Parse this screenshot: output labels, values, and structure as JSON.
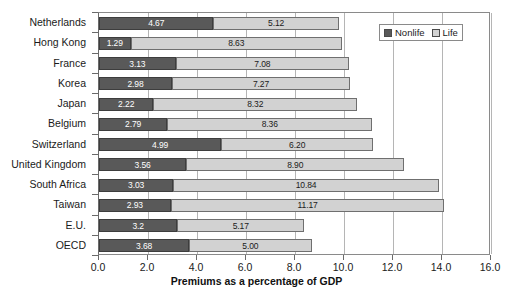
{
  "chart_data": {
    "type": "bar",
    "orientation": "horizontal",
    "stacked": true,
    "title": "",
    "xlabel": "Premiums as a percentage of GDP",
    "ylabel": "",
    "xlim": [
      0.0,
      16.0
    ],
    "xticks": [
      "0.0",
      "2.0",
      "4.0",
      "6.0",
      "8.0",
      "10.0",
      "12.0",
      "14.0",
      "16.0"
    ],
    "xtick_values": [
      0.0,
      2.0,
      4.0,
      6.0,
      8.0,
      10.0,
      12.0,
      14.0,
      16.0
    ],
    "grid": "vertical",
    "legend_position": "top-right",
    "categories": [
      "Netherlands",
      "Hong Kong",
      "France",
      "Korea",
      "Japan",
      "Belgium",
      "Switzerland",
      "United Kingdom",
      "South Africa",
      "Taiwan",
      "E.U.",
      "OECD"
    ],
    "series": [
      {
        "name": "Nonlife",
        "color": "#595959",
        "values": [
          4.67,
          1.29,
          3.13,
          2.98,
          2.22,
          2.79,
          4.99,
          3.56,
          3.03,
          2.93,
          3.2,
          3.68
        ],
        "labels": [
          "4.67",
          "1.29",
          "3.13",
          "2.98",
          "2.22",
          "2.79",
          "4.99",
          "3.56",
          "3.03",
          "2.93",
          "3.2",
          "3.68"
        ]
      },
      {
        "name": "Life",
        "color": "#d2d2d2",
        "values": [
          5.12,
          8.63,
          7.08,
          7.27,
          8.32,
          8.36,
          6.2,
          8.9,
          10.84,
          11.17,
          5.17,
          5.0
        ],
        "labels": [
          "5.12",
          "8.63",
          "7.08",
          "7.27",
          "8.32",
          "8.36",
          "6.20",
          "8.90",
          "10.84",
          "11.17",
          "5.17",
          "5.00"
        ]
      }
    ]
  },
  "legend": {
    "items": [
      {
        "label": "Nonlife",
        "swatch": "nonlife"
      },
      {
        "label": "Life",
        "swatch": "life"
      }
    ]
  }
}
